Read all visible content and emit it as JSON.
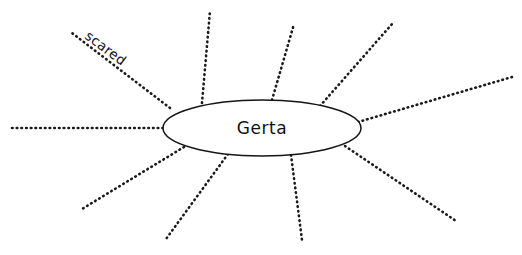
{
  "worksheet": {
    "type": "word-web",
    "width": 522,
    "height": 255,
    "background_color": "#ffffff",
    "ink_color": "#151515"
  },
  "center": {
    "label": "Gerta",
    "cx": 262,
    "cy": 128,
    "rx": 99,
    "ry": 28
  },
  "rays": [
    {
      "name": "ray-left",
      "x1": 163,
      "y1": 128,
      "x2": 12,
      "y2": 128,
      "label": ""
    },
    {
      "name": "ray-upper-left-scared",
      "x1": 170,
      "y1": 108,
      "x2": 72,
      "y2": 33,
      "label": "scared"
    },
    {
      "name": "ray-top-left",
      "x1": 202,
      "y1": 103,
      "x2": 210,
      "y2": 11,
      "label": ""
    },
    {
      "name": "ray-top-center",
      "x1": 272,
      "y1": 100,
      "x2": 294,
      "y2": 24,
      "label": ""
    },
    {
      "name": "ray-top-right",
      "x1": 320,
      "y1": 106,
      "x2": 392,
      "y2": 24,
      "label": ""
    },
    {
      "name": "ray-right-shallow",
      "x1": 358,
      "y1": 122,
      "x2": 512,
      "y2": 77,
      "label": ""
    },
    {
      "name": "ray-lower-right",
      "x1": 345,
      "y1": 146,
      "x2": 456,
      "y2": 221,
      "label": ""
    },
    {
      "name": "ray-bottom-right",
      "x1": 291,
      "y1": 155,
      "x2": 302,
      "y2": 240,
      "label": ""
    },
    {
      "name": "ray-bottom-left",
      "x1": 228,
      "y1": 154,
      "x2": 166,
      "y2": 239,
      "label": ""
    },
    {
      "name": "ray-lower-left",
      "x1": 184,
      "y1": 147,
      "x2": 82,
      "y2": 209,
      "label": ""
    }
  ],
  "branch_labels": [
    {
      "text": "scared",
      "x": 103,
      "y": 52,
      "rotation": 37
    }
  ]
}
